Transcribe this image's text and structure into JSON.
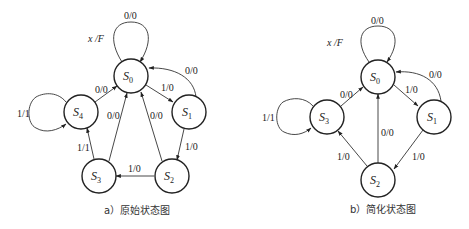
{
  "figures": [
    {
      "id": "a",
      "caption": "a）原始状态图",
      "legend": "x /F",
      "states": [
        {
          "name": "S",
          "sub": "0"
        },
        {
          "name": "S",
          "sub": "1"
        },
        {
          "name": "S",
          "sub": "2"
        },
        {
          "name": "S",
          "sub": "3"
        },
        {
          "name": "S",
          "sub": "4"
        }
      ],
      "transitions": [
        {
          "from": "S0",
          "to": "S0",
          "label": "0/0"
        },
        {
          "from": "S0",
          "to": "S1",
          "label": "1/0"
        },
        {
          "from": "S1",
          "to": "S0",
          "label": "0/0"
        },
        {
          "from": "S1",
          "to": "S2",
          "label": "1/0"
        },
        {
          "from": "S2",
          "to": "S0",
          "label": "0/0"
        },
        {
          "from": "S2",
          "to": "S3",
          "label": "1/0"
        },
        {
          "from": "S3",
          "to": "S0",
          "label": "0/0"
        },
        {
          "from": "S3",
          "to": "S4",
          "label": "1/1"
        },
        {
          "from": "S4",
          "to": "S0",
          "label": "0/0"
        },
        {
          "from": "S4",
          "to": "S4",
          "label": "1/1"
        }
      ]
    },
    {
      "id": "b",
      "caption": "b）简化状态图",
      "legend": "x /F",
      "states": [
        {
          "name": "S",
          "sub": "0"
        },
        {
          "name": "S",
          "sub": "1"
        },
        {
          "name": "S",
          "sub": "2"
        },
        {
          "name": "S",
          "sub": "3"
        }
      ],
      "transitions": [
        {
          "from": "S0",
          "to": "S0",
          "label": "0/0"
        },
        {
          "from": "S0",
          "to": "S1",
          "label": "1/0"
        },
        {
          "from": "S1",
          "to": "S0",
          "label": "0/0"
        },
        {
          "from": "S1",
          "to": "S2",
          "label": "1/0"
        },
        {
          "from": "S2",
          "to": "S0",
          "label": "0/0"
        },
        {
          "from": "S2",
          "to": "S3",
          "label": "1/0"
        },
        {
          "from": "S3",
          "to": "S0",
          "label": "0/0"
        },
        {
          "from": "S3",
          "to": "S3",
          "label": "1/1"
        }
      ]
    }
  ]
}
